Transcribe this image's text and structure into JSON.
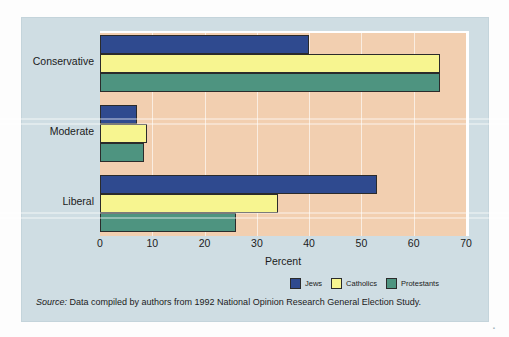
{
  "chart_data": {
    "type": "bar",
    "orientation": "horizontal",
    "title": "",
    "xlabel": "Percent",
    "ylabel": "",
    "xlim": [
      0,
      70
    ],
    "xticks": [
      0,
      10,
      20,
      30,
      40,
      50,
      60,
      70
    ],
    "xtick_labels": [
      "0",
      "10",
      "20",
      "30",
      "40",
      "50",
      "60",
      "70"
    ],
    "grid": true,
    "grid_axis": "x",
    "legend_position": "bottom-right",
    "categories": [
      "Conservative",
      "Moderate",
      "Liberal"
    ],
    "series": [
      {
        "name": "Jews",
        "color": "#2f4a8f",
        "values": [
          40,
          7,
          53
        ]
      },
      {
        "name": "Catholics",
        "color": "#f7f590",
        "values": [
          65,
          9,
          34
        ]
      },
      {
        "name": "Protestants",
        "color": "#4e9480",
        "values": [
          65,
          8.5,
          26
        ]
      }
    ]
  },
  "axis": {
    "x_title": "Percent"
  },
  "legend": {
    "items": [
      {
        "label": "Jews",
        "color": "#2f4a8f"
      },
      {
        "label": "Catholics",
        "color": "#f7f590"
      },
      {
        "label": "Protestants",
        "color": "#4e9480"
      }
    ]
  },
  "source": {
    "prefix": "Source:",
    "text": " Data compiled by authors from 1992 National Opinion Research General Election Study."
  },
  "page_mark": "▪",
  "colors": {
    "panel_background": "#cfdde3",
    "plot_background": "#f2cfb0",
    "bar_outline": "#2b2b2b",
    "gridline": "#ffffff"
  }
}
